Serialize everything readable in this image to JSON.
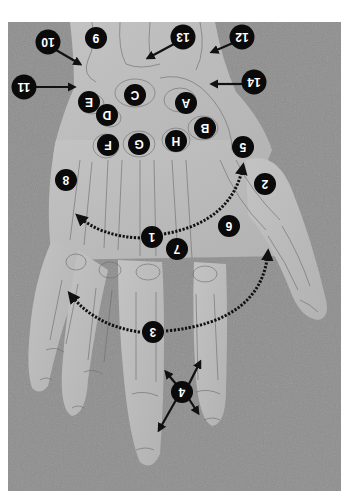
{
  "figure": {
    "orientation": "rotated 180 degrees",
    "colors": {
      "background": "#8c8c8c",
      "skin": "#b9b9b9",
      "skin_highlight": "#c9c9c9",
      "bone_outline": "#6e6e6e",
      "marker_fill": "#0a0a0a",
      "marker_text": "#ffffff",
      "arrow": "#111111",
      "page": "#ffffff"
    }
  },
  "markers": [
    {
      "id": "m10",
      "label": "10",
      "x": 48,
      "y": 42
    },
    {
      "id": "m9",
      "label": "9",
      "x": 96,
      "y": 38
    },
    {
      "id": "m13",
      "label": "13",
      "x": 183,
      "y": 37
    },
    {
      "id": "m12",
      "label": "12",
      "x": 242,
      "y": 37
    },
    {
      "id": "m11",
      "label": "11",
      "x": 24,
      "y": 87
    },
    {
      "id": "m14",
      "label": "14",
      "x": 254,
      "y": 82
    },
    {
      "id": "mC",
      "label": "C",
      "x": 135,
      "y": 95
    },
    {
      "id": "mA",
      "label": "A",
      "x": 186,
      "y": 103
    },
    {
      "id": "mE",
      "label": "E",
      "x": 89,
      "y": 102
    },
    {
      "id": "mD",
      "label": "D",
      "x": 107,
      "y": 115
    },
    {
      "id": "mB",
      "label": "B",
      "x": 205,
      "y": 128
    },
    {
      "id": "mH",
      "label": "H",
      "x": 176,
      "y": 141
    },
    {
      "id": "mG",
      "label": "G",
      "x": 139,
      "y": 144
    },
    {
      "id": "mF",
      "label": "F",
      "x": 108,
      "y": 145
    },
    {
      "id": "m5",
      "label": "5",
      "x": 243,
      "y": 147
    },
    {
      "id": "m8",
      "label": "8",
      "x": 66,
      "y": 180
    },
    {
      "id": "m2",
      "label": "2",
      "x": 265,
      "y": 184
    },
    {
      "id": "m6",
      "label": "6",
      "x": 229,
      "y": 226
    },
    {
      "id": "m1",
      "label": "1",
      "x": 152,
      "y": 237
    },
    {
      "id": "m7",
      "label": "7",
      "x": 177,
      "y": 249
    },
    {
      "id": "m3",
      "label": "3",
      "x": 153,
      "y": 332
    },
    {
      "id": "m4",
      "label": "4",
      "x": 182,
      "y": 392
    }
  ],
  "arrows": [
    {
      "from": "10",
      "type": "solid",
      "x1": 56,
      "y1": 50,
      "x2": 80,
      "y2": 64
    },
    {
      "from": "13",
      "type": "solid",
      "x1": 174,
      "y1": 44,
      "x2": 148,
      "y2": 58
    },
    {
      "from": "12",
      "type": "solid",
      "x1": 233,
      "y1": 43,
      "x2": 212,
      "y2": 52
    },
    {
      "from": "11",
      "type": "solid",
      "x1": 36,
      "y1": 87,
      "x2": 74,
      "y2": 87
    },
    {
      "from": "14",
      "type": "solid",
      "x1": 242,
      "y1": 84,
      "x2": 212,
      "y2": 84
    },
    {
      "from": "1",
      "type": "dotted-arc",
      "path": "M 140 238 Q 100 236 78 216"
    },
    {
      "from": "1",
      "type": "dotted-arc",
      "path": "M 164 234 Q 232 222 243 166"
    },
    {
      "from": "3",
      "type": "dotted-arc",
      "path": "M 140 332 Q 95 326 70 294"
    },
    {
      "from": "3",
      "type": "dotted-arc",
      "path": "M 166 331 Q 262 322 268 252"
    },
    {
      "from": "4",
      "type": "solid",
      "x1": 176,
      "y1": 384,
      "x2": 166,
      "y2": 372
    },
    {
      "from": "4",
      "type": "solid",
      "x1": 189,
      "y1": 384,
      "x2": 200,
      "y2": 362
    },
    {
      "from": "4",
      "type": "solid",
      "x1": 176,
      "y1": 400,
      "x2": 159,
      "y2": 430
    },
    {
      "from": "4",
      "type": "solid",
      "x1": 189,
      "y1": 399,
      "x2": 198,
      "y2": 413
    }
  ]
}
